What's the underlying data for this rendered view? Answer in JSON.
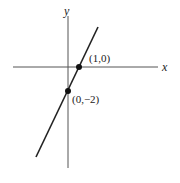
{
  "diagram": {
    "type": "coordinate-plane-line",
    "axes": {
      "x_label": "x",
      "y_label": "y"
    },
    "line": {
      "description": "straight line with positive slope through two marked points",
      "equation": "y = 2x - 2"
    },
    "points": [
      {
        "label": "(1,0)",
        "x": 1,
        "y": 0
      },
      {
        "label": "(0,−2)",
        "x": 0,
        "y": -2
      }
    ],
    "colors": {
      "axis": "#555555",
      "line": "#222222",
      "point": "#111111",
      "text": "#222222"
    }
  }
}
